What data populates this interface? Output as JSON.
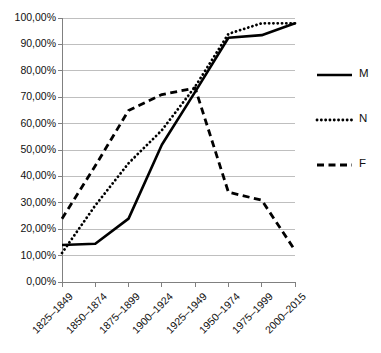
{
  "chart_data": {
    "type": "line",
    "title": "",
    "xlabel": "",
    "ylabel": "",
    "categories": [
      "1825–1849",
      "1850–1874",
      "1875–1899",
      "1900–1924",
      "1925–1949",
      "1950–1974",
      "1975–1999",
      "2000–2015"
    ],
    "ytick_labels": [
      "0,00%",
      "10,00%",
      "20,00%",
      "30,00%",
      "40,00%",
      "50,00%",
      "60,00%",
      "70,00%",
      "80,00%",
      "90,00%",
      "100,00%"
    ],
    "ytick_values": [
      0,
      10,
      20,
      30,
      40,
      50,
      60,
      70,
      80,
      90,
      100
    ],
    "ylim": [
      0,
      100
    ],
    "grid": true,
    "legend_position": "right",
    "series": [
      {
        "name": "M",
        "style": "solid",
        "color": "#000000",
        "values": [
          14.0,
          14.5,
          24.0,
          52.0,
          72.0,
          92.5,
          93.5,
          98.0
        ]
      },
      {
        "name": "N",
        "style": "dotted",
        "color": "#000000",
        "values": [
          11.0,
          29.0,
          45.0,
          57.5,
          74.0,
          94.0,
          98.0,
          98.0
        ]
      },
      {
        "name": "F",
        "style": "dashed",
        "color": "#000000",
        "values": [
          24.0,
          44.0,
          65.0,
          71.0,
          73.5,
          34.0,
          31.0,
          12.0
        ]
      }
    ]
  },
  "axis": {
    "tick_color": "#808080",
    "grid_color": "#bfbfbf",
    "axis_color": "#808080"
  }
}
